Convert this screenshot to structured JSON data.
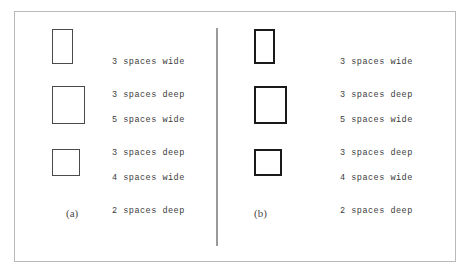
{
  "figure": {
    "background_color": "#ffffff",
    "frame_color": "#b9b9b9",
    "divider_color": "#9a9a9a",
    "panels": [
      {
        "id": "a",
        "label": "(a)",
        "stroke_weight": "thin",
        "stroke_color": "#4a4a4a",
        "rows": [
          {
            "name": "3x3",
            "width_spaces": 3,
            "depth_spaces": 3,
            "line1": "3 spaces wide",
            "line2": "3 spaces deep"
          },
          {
            "name": "5x3",
            "width_spaces": 5,
            "depth_spaces": 3,
            "line1": "5 spaces wide",
            "line2": "3 spaces deep"
          },
          {
            "name": "4x2",
            "width_spaces": 4,
            "depth_spaces": 2,
            "line1": "4 spaces wide",
            "line2": "2 spaces deep"
          }
        ]
      },
      {
        "id": "b",
        "label": "(b)",
        "stroke_weight": "thick",
        "stroke_color": "#1a1a1a",
        "rows": [
          {
            "name": "3x3",
            "width_spaces": 3,
            "depth_spaces": 3,
            "line1": "3 spaces wide",
            "line2": "3 spaces deep"
          },
          {
            "name": "5x3",
            "width_spaces": 5,
            "depth_spaces": 3,
            "line1": "5 spaces wide",
            "line2": "3 spaces deep"
          },
          {
            "name": "4x2",
            "width_spaces": 4,
            "depth_spaces": 2,
            "line1": "4 spaces wide",
            "line2": "2 spaces deep"
          }
        ]
      }
    ]
  }
}
